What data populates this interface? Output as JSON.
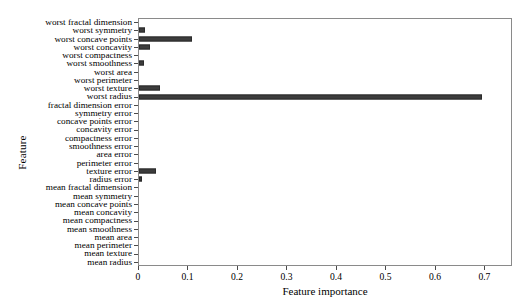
{
  "chart_data": {
    "type": "bar",
    "orientation": "horizontal",
    "title": "",
    "xlabel": "Feature importance",
    "ylabel": "Feature",
    "xlim": [
      0,
      0.7557
    ],
    "xticks": [
      0,
      0.1,
      0.2,
      0.3,
      0.4,
      0.5,
      0.6,
      0.7
    ],
    "xticklabels": [
      "0",
      "0.1",
      "0.2",
      "0.3",
      "0.4",
      "0.5",
      "0.6",
      "0.7"
    ],
    "grid": false,
    "legend": null,
    "bar_color": "#3c3c3c",
    "categories": [
      "mean radius",
      "mean texture",
      "mean perimeter",
      "mean area",
      "mean smoothness",
      "mean compactness",
      "mean concavity",
      "mean concave points",
      "mean symmetry",
      "mean fractal dimension",
      "radius error",
      "texture error",
      "perimeter error",
      "area error",
      "smoothness error",
      "compactness error",
      "concavity error",
      "concave points error",
      "symmetry error",
      "fractal dimension error",
      "worst radius",
      "worst texture",
      "worst perimeter",
      "worst area",
      "worst smoothness",
      "worst compactness",
      "worst concavity",
      "worst concave points",
      "worst symmetry",
      "worst fractal dimension"
    ],
    "values": [
      0.0,
      0.0,
      0.0,
      0.0,
      0.0,
      0.0,
      0.0,
      0.0,
      0.0,
      0.0,
      0.006,
      0.035,
      0.0,
      0.0,
      0.0,
      0.0,
      0.0,
      0.0,
      0.0,
      0.0,
      0.697,
      0.043,
      0.0,
      0.0,
      0.011,
      0.0,
      0.023,
      0.107,
      0.012,
      0.0
    ]
  }
}
